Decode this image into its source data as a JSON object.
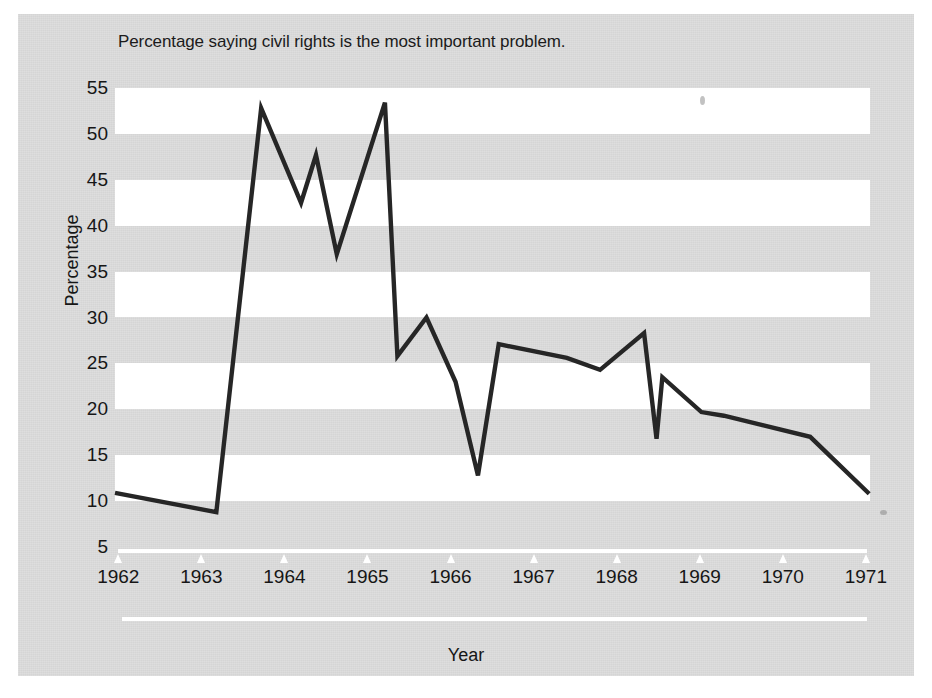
{
  "chart_title": "Percentage saying civil rights is the most important problem.",
  "axes": {
    "y_title": "Percentage",
    "x_title": "Year",
    "y_ticks": [
      "55",
      "50",
      "45",
      "40",
      "35",
      "30",
      "25",
      "20",
      "15",
      "5"
    ],
    "y_tick_10": "10",
    "x_ticks": [
      "1962",
      "1963",
      "1964",
      "1965",
      "1966",
      "1967",
      "1968",
      "1969",
      "1970",
      "1971"
    ]
  },
  "chart_data": {
    "type": "line",
    "title": "Percentage saying civil rights is the most important problem.",
    "xlabel": "Year",
    "ylabel": "Percentage",
    "xlim": [
      1961.96,
      1971.05
    ],
    "ylim": [
      5,
      55
    ],
    "ytick_values": [
      5,
      10,
      15,
      20,
      25,
      30,
      35,
      40,
      45,
      50,
      55
    ],
    "xtick_values": [
      1962,
      1963,
      1964,
      1965,
      1966,
      1967,
      1968,
      1969,
      1970,
      1971
    ],
    "grid": false,
    "banded_background": true,
    "legend": "none",
    "line_color": "#262626",
    "series": [
      {
        "name": "Civil rights most important problem",
        "x": [
          1961.96,
          1963.18,
          1963.72,
          1964.2,
          1964.38,
          1964.63,
          1965.21,
          1965.36,
          1965.71,
          1966.06,
          1966.33,
          1966.58,
          1967.4,
          1967.8,
          1968.33,
          1968.48,
          1968.55,
          1969.02,
          1969.29,
          1970.33,
          1971.04
        ],
        "y": [
          10.9,
          8.8,
          52.8,
          42.5,
          47.7,
          36.9,
          53.4,
          25.8,
          30.0,
          23.0,
          12.8,
          27.1,
          25.6,
          24.3,
          28.3,
          16.8,
          23.5,
          19.7,
          19.3,
          17.0,
          10.8
        ],
        "values": [
          10.9,
          8.8,
          52.8,
          42.5,
          47.7,
          36.9,
          53.4,
          25.8,
          30.0,
          23.0,
          12.8,
          27.1,
          25.6,
          24.3,
          28.3,
          16.8,
          23.5,
          19.7,
          19.3,
          17.0,
          10.8
        ]
      }
    ]
  }
}
